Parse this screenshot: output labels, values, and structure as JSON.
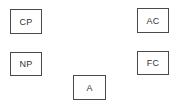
{
  "diagram": {
    "nodes": [
      {
        "id": "cp",
        "label": "CP",
        "position": "top-left"
      },
      {
        "id": "ac",
        "label": "AC",
        "position": "top-right"
      },
      {
        "id": "np",
        "label": "NP",
        "position": "middle-left"
      },
      {
        "id": "fc",
        "label": "FC",
        "position": "middle-right"
      },
      {
        "id": "a",
        "label": "A",
        "position": "bottom-center"
      }
    ],
    "edges": []
  },
  "colors": {
    "border": "#4a4a4a",
    "text": "#333333",
    "background": "#ffffff"
  }
}
